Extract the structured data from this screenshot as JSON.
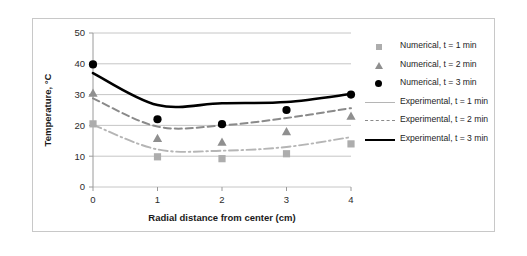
{
  "chart_data": {
    "type": "line",
    "title": "",
    "xlabel": "Radial distance from center (cm)",
    "ylabel": "Temperature, °C",
    "xlim": [
      0,
      4
    ],
    "ylim": [
      0,
      50
    ],
    "xticks": [
      "0",
      "1",
      "2",
      "3",
      "4"
    ],
    "yticks": [
      "0",
      "10",
      "20",
      "30",
      "40",
      "50"
    ],
    "grid": "horizontal",
    "legend_position": "right",
    "x": [
      0,
      1,
      2,
      3,
      4
    ],
    "series": [
      {
        "name": "Numerical, t = 1 min",
        "style": "markers",
        "marker": "square",
        "color": "#adadad",
        "values": [
          20.5,
          9.8,
          9.2,
          10.8,
          14.0
        ]
      },
      {
        "name": "Numerical, t = 2 min",
        "style": "markers",
        "marker": "triangle",
        "color": "#8f8f8f",
        "values": [
          30.5,
          15.8,
          14.6,
          18.0,
          23.0
        ]
      },
      {
        "name": "Numerical, t = 3 min",
        "style": "markers",
        "marker": "circle",
        "color": "#000000",
        "values": [
          39.8,
          22.0,
          20.4,
          25.0,
          30.0
        ]
      },
      {
        "name": "Experimental, t = 1 min",
        "style": "line",
        "line": "dash-dot",
        "color": "#b5b5b5",
        "values": [
          20.2,
          12.2,
          11.8,
          13.0,
          16.2
        ]
      },
      {
        "name": "Experimental, t = 2 min",
        "style": "line",
        "line": "dashed",
        "color": "#8a8a8a",
        "values": [
          28.8,
          19.6,
          20.0,
          22.4,
          25.6
        ]
      },
      {
        "name": "Experimental, t = 3 min",
        "style": "line",
        "line": "solid",
        "color": "#000000",
        "values": [
          37.0,
          26.6,
          27.2,
          27.6,
          30.2
        ]
      }
    ]
  },
  "legend": {
    "items": [
      {
        "label": "Numerical, t = 1 min",
        "key": "square-marker-key"
      },
      {
        "label": "Numerical, t = 2 min",
        "key": "triangle-marker-key"
      },
      {
        "label": "Numerical, t = 3 min",
        "key": "circle-marker-key"
      },
      {
        "label": "Experimental, t = 1 min",
        "key": "dash-dot-line-key"
      },
      {
        "label": "Experimental, t = 2 min",
        "key": "dashed-line-key"
      },
      {
        "label": "Experimental, t = 3 min",
        "key": "solid-line-key"
      }
    ]
  },
  "caption": {
    "text": ""
  }
}
